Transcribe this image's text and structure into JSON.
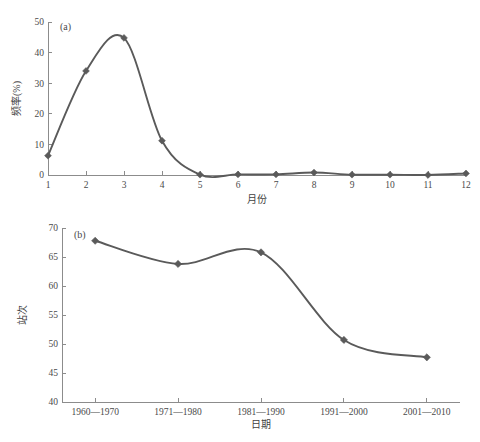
{
  "figure": {
    "background": "#ffffff",
    "series_color": "#5a5a5a",
    "axis_color": "#8c8c8c",
    "text_color": "#3f3f3f"
  },
  "chart_data": [
    {
      "id": "panel-a",
      "type": "line",
      "panel_label": "(a)",
      "title": "",
      "xlabel": "月份",
      "ylabel": "频率(%)",
      "categories": [
        "1",
        "2",
        "3",
        "4",
        "5",
        "6",
        "7",
        "8",
        "9",
        "10",
        "11",
        "12"
      ],
      "x": [
        1,
        2,
        3,
        4,
        5,
        6,
        7,
        8,
        9,
        10,
        11,
        12
      ],
      "values": [
        6.3,
        34.0,
        44.8,
        11.2,
        0.1,
        0.2,
        0.2,
        0.8,
        0.1,
        0.1,
        0.0,
        0.5
      ],
      "xlim": [
        1,
        12
      ],
      "ylim": [
        0,
        50
      ],
      "yticks": [
        0,
        10,
        20,
        30,
        40,
        50
      ],
      "ytick_labels": [
        "0",
        "10",
        "20",
        "30",
        "40",
        "50"
      ],
      "xticks": [
        1,
        2,
        3,
        4,
        5,
        6,
        7,
        8,
        9,
        10,
        11,
        12
      ],
      "xtick_labels": [
        "1",
        "2",
        "3",
        "4",
        "5",
        "6",
        "7",
        "8",
        "9",
        "10",
        "11",
        "12"
      ],
      "grid": false,
      "legend": "none",
      "marker": "diamond",
      "smooth": true
    },
    {
      "id": "panel-b",
      "type": "line",
      "panel_label": "(b)",
      "title": "",
      "xlabel": "日期",
      "ylabel": "站次",
      "categories": [
        "1960—1970",
        "1971—1980",
        "1981—1990",
        "1991—2000",
        "2001—2010"
      ],
      "x": [
        1,
        2,
        3,
        4,
        5
      ],
      "values": [
        67.8,
        63.8,
        65.8,
        50.7,
        47.7
      ],
      "xlim": [
        0.6,
        5.4
      ],
      "ylim": [
        40,
        70
      ],
      "yticks": [
        40,
        45,
        50,
        55,
        60,
        65,
        70
      ],
      "ytick_labels": [
        "40",
        "45",
        "50",
        "55",
        "60",
        "65",
        "70"
      ],
      "xticks": [
        1,
        2,
        3,
        4,
        5
      ],
      "xtick_labels": [
        "1960—1970",
        "1971—1980",
        "1981—1990",
        "1991—2000",
        "2001—2010"
      ],
      "grid": false,
      "legend": "none",
      "marker": "diamond",
      "smooth": true
    }
  ]
}
